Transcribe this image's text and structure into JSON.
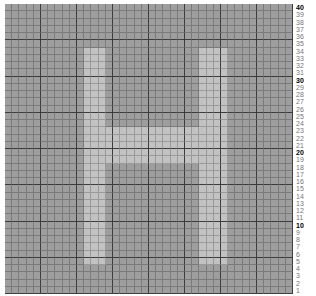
{
  "chart_data": {
    "type": "heatmap",
    "title": "",
    "columns": 40,
    "rows": 40,
    "row_labels_right": [
      "40",
      "39",
      "38",
      "37",
      "36",
      "35",
      "34",
      "33",
      "32",
      "31",
      "30",
      "29",
      "28",
      "27",
      "26",
      "25",
      "24",
      "23",
      "22",
      "21",
      "20",
      "19",
      "18",
      "17",
      "16",
      "15",
      "14",
      "13",
      "12",
      "11",
      "10",
      "9",
      "8",
      "7",
      "6",
      "5",
      "4",
      "3",
      "2",
      "1"
    ],
    "bold_labels": [
      "40",
      "30",
      "20",
      "10"
    ],
    "major_grid_every": 5,
    "colors": {
      "background_cell": "#9e9e9e",
      "filled_cell": "#c2c2c2",
      "minor_line": "#7a7a7a",
      "major_line": "#3c3c3c"
    },
    "shape": {
      "letter": "H",
      "left_bar": {
        "col_start": 11,
        "col_end": 13,
        "row_start": 6,
        "row_end": 35
      },
      "right_bar": {
        "col_start": 27,
        "col_end": 30,
        "row_start": 6,
        "row_end": 35
      },
      "crossbar": {
        "col_start": 11,
        "col_end": 30,
        "row_start": 17,
        "row_end": 21
      }
    }
  }
}
